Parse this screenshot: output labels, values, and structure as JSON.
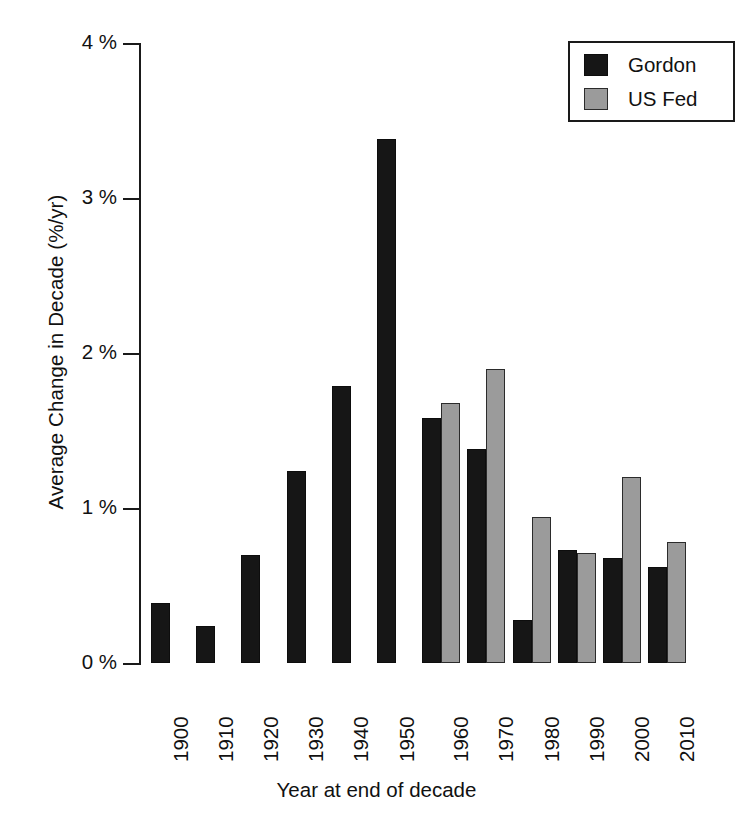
{
  "chart_data": {
    "type": "bar",
    "title": "",
    "xlabel": "Year at end of decade",
    "ylabel": "Average Change in Decade (%/yr)",
    "categories": [
      "1900",
      "1910",
      "1920",
      "1930",
      "1940",
      "1950",
      "1960",
      "1970",
      "1980",
      "1990",
      "2000",
      "2010"
    ],
    "series": [
      {
        "name": "Gordon",
        "color": "#161616",
        "values": [
          0.39,
          0.24,
          0.7,
          1.24,
          1.79,
          3.38,
          1.58,
          1.38,
          0.28,
          0.73,
          0.68,
          0.62
        ]
      },
      {
        "name": "US Fed",
        "color": "#9b9b9b",
        "values": [
          null,
          null,
          null,
          null,
          null,
          null,
          1.68,
          1.9,
          0.94,
          0.71,
          1.2,
          0.78
        ]
      }
    ],
    "ylim": [
      0,
      4
    ],
    "yticks": [
      0,
      1,
      2,
      3,
      4
    ],
    "ytick_labels": [
      "0 %",
      "1 %",
      "2 %",
      "3 %",
      "4 %"
    ],
    "grid": false,
    "legend_position": "top-right"
  },
  "axes": {
    "y_title": "Average Change in Decade (%/yr)",
    "x_title": "Year at end of decade",
    "y_ticks": [
      {
        "value": 4,
        "label": "4 %"
      },
      {
        "value": 3,
        "label": "3 %"
      },
      {
        "value": 2,
        "label": "2 %"
      },
      {
        "value": 1,
        "label": "1 %"
      },
      {
        "value": 0,
        "label": "0 %"
      }
    ],
    "x_ticks": [
      "1900",
      "1910",
      "1920",
      "1930",
      "1940",
      "1950",
      "1960",
      "1970",
      "1980",
      "1990",
      "2000",
      "2010"
    ]
  },
  "legend": {
    "entries": [
      {
        "label": "Gordon",
        "swatch": "black-square-swatch"
      },
      {
        "label": "US Fed",
        "swatch": "gray-square-swatch"
      }
    ]
  }
}
